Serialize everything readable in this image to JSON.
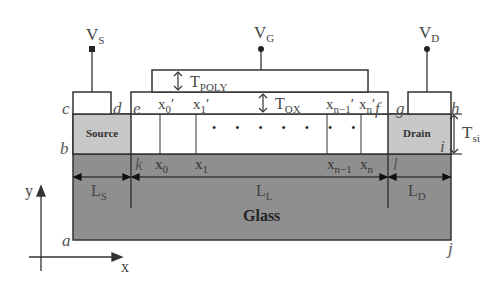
{
  "diagram": {
    "type": "SOI MOSFET cross-section",
    "terminals": {
      "source": {
        "symbol": "V",
        "sub": "S"
      },
      "gate": {
        "symbol": "V",
        "sub": "G"
      },
      "drain": {
        "symbol": "V",
        "sub": "D"
      }
    },
    "regions": {
      "source": "Source",
      "drain": "Drain",
      "substrate": "Glass"
    },
    "dimensions": {
      "t_poly": {
        "symbol": "T",
        "sub": "POLY"
      },
      "t_ox": {
        "symbol": "T",
        "sub": "OX"
      },
      "t_si": {
        "symbol": "T",
        "sub": "si"
      },
      "l_s": {
        "symbol": "L",
        "sub": "S"
      },
      "l_l": {
        "symbol": "L",
        "sub": "L"
      },
      "l_d": {
        "symbol": "L",
        "sub": "D"
      }
    },
    "corner_points": {
      "a": "a",
      "b": "b",
      "c": "c",
      "d": "d",
      "e": "e",
      "f": "f",
      "g": "g",
      "h": "h",
      "i": "i",
      "j": "j",
      "k": "k",
      "l": "l"
    },
    "top_grid_points": [
      {
        "symbol": "x",
        "sub": "0",
        "prime": "′"
      },
      {
        "symbol": "x",
        "sub": "1",
        "prime": "′"
      },
      {
        "symbol": "x",
        "sub": "n−1",
        "prime": "′"
      },
      {
        "symbol": "x",
        "sub": "n",
        "prime": "′"
      }
    ],
    "bottom_grid_points": [
      {
        "symbol": "x",
        "sub": "0"
      },
      {
        "symbol": "x",
        "sub": "1"
      },
      {
        "symbol": "x",
        "sub": "n−1"
      },
      {
        "symbol": "x",
        "sub": "n"
      }
    ],
    "ellipsis": "• • • • • • •",
    "axes": {
      "x": "x",
      "y": "y"
    },
    "colors": {
      "source_drain_fill": "#c8c8c8",
      "glass_fill": "#8f8f8f",
      "outline": "#333333"
    }
  }
}
